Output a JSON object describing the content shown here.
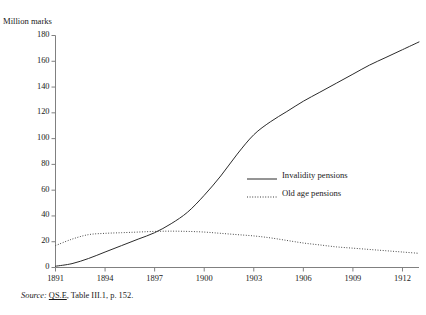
{
  "figure": {
    "clipped_title": "Invalidity and old age pensions",
    "y_axis_caption": "Million marks",
    "source": {
      "label": "Source:",
      "reference": "QS.E",
      "rest": ", Table III.1, p. 152."
    }
  },
  "legend": {
    "position": "inside-right",
    "entries": [
      {
        "label": "Invalidity pensions",
        "style": "solid",
        "color": "#2b2b2b"
      },
      {
        "label": "Old age pensions",
        "style": "dotted",
        "color": "#3a3a3a"
      }
    ]
  },
  "chart_data": {
    "type": "line",
    "title": "Invalidity and old age pensions",
    "xlabel": "",
    "ylabel": "Million marks",
    "xlim": [
      1891,
      1913
    ],
    "ylim": [
      0,
      180
    ],
    "ytick_values": [
      0,
      20,
      40,
      60,
      80,
      100,
      120,
      140,
      160,
      180
    ],
    "xtick_values": [
      1891,
      1894,
      1897,
      1900,
      1903,
      1906,
      1909,
      1912
    ],
    "xtick_labels": [
      "1891",
      "1894",
      "1897",
      "1900",
      "1903",
      "1906",
      "1909",
      "1912"
    ],
    "grid": false,
    "x": [
      1891,
      1892,
      1893,
      1894,
      1895,
      1896,
      1897,
      1898,
      1899,
      1900,
      1901,
      1902,
      1903,
      1904,
      1905,
      1906,
      1907,
      1908,
      1909,
      1910,
      1911,
      1912,
      1913
    ],
    "series": [
      {
        "name": "Invalidity pensions",
        "style": "solid",
        "color": "#2b2b2b",
        "values": [
          1,
          3,
          7,
          12,
          17,
          22,
          27,
          34,
          43,
          56,
          71,
          88,
          103,
          113,
          121,
          129,
          136,
          143,
          150,
          157,
          163,
          169,
          175
        ]
      },
      {
        "name": "Old age pensions",
        "style": "dotted",
        "color": "#3a3a3a",
        "values": [
          17,
          22,
          25.5,
          26.5,
          27,
          27.5,
          28,
          28.2,
          28,
          27.5,
          26.5,
          25.5,
          24.5,
          23,
          21,
          19,
          17.5,
          16,
          15,
          14,
          13,
          12,
          11
        ]
      }
    ]
  }
}
